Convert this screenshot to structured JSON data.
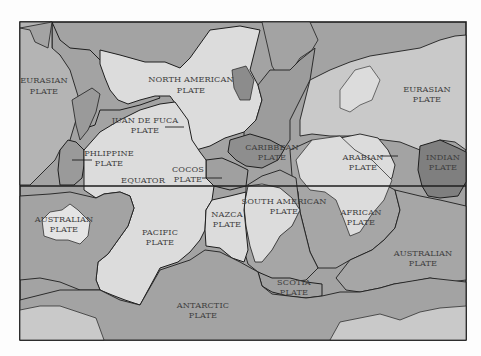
{
  "map": {
    "title": "Tectonic plates world map",
    "colors": {
      "background": "#fdfdfd",
      "light_land": "#dcdcdc",
      "mid": "#a3a3a3",
      "dark": "#7f7f7f",
      "border": "#1e1e1e",
      "text": "#3e3e3e"
    },
    "labels": {
      "eurasian_w_1": "EURASIAN",
      "eurasian_w_2": "PLATE",
      "north_american_1": "NORTH AMERICAN",
      "north_american_2": "PLATE",
      "eurasian_e_1": "EURASIAN",
      "eurasian_e_2": "PLATE",
      "juan_de_fuca_1": "JUAN DE FUCA",
      "juan_de_fuca_2": "PLATE",
      "philippine_1": "PHLIPPINE",
      "philippine_2": "PLATE",
      "caribbean_1": "CARIBBEAN",
      "caribbean_2": "PLATE",
      "arabian_1": "ARABIAN",
      "arabian_2": "PLATE",
      "indian_1": "INDIAN",
      "indian_2": "PLATE",
      "cocos_1": "COCOS",
      "cocos_2": "PLATE",
      "equator": "EQUATOR",
      "australian_w_1": "AUSTRALIAN",
      "australian_w_2": "PLATE",
      "pacific_1": "PACIFIC",
      "pacific_2": "PLATE",
      "nazca_1": "NAZCA",
      "nazca_2": "PLATE",
      "south_american_1": "SOUTH AMERICAN",
      "south_american_2": "PLATE",
      "african_1": "AFRICAN",
      "african_2": "PLATE",
      "australian_e_1": "AUSTRALIAN",
      "australian_e_2": "PLATE",
      "scotia_1": "SCOTIA",
      "scotia_2": "PLATE",
      "antarctic_1": "ANTARCTIC",
      "antarctic_2": "PLATE"
    }
  }
}
